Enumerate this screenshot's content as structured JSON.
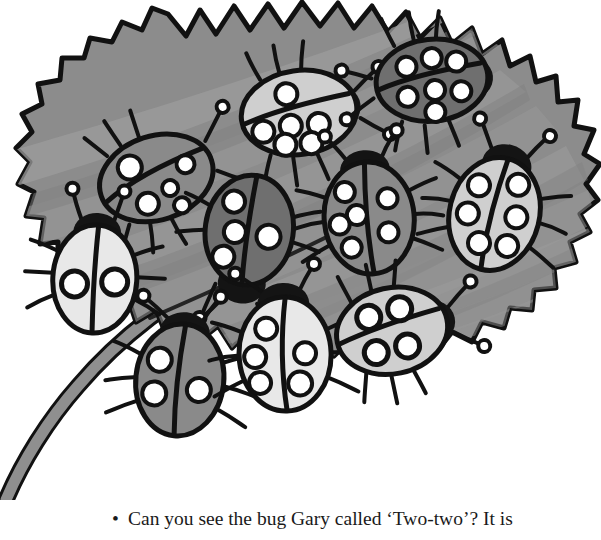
{
  "page": {
    "background_color": "#ffffff",
    "width": 601,
    "height": 540
  },
  "caption": {
    "bullet": "•",
    "text": "Can you see the bug Gary called ‘Two-two’? It is",
    "full_line": "• Can you see the bug Gary called ‘Two-two’? It is",
    "color": "#1a1a1a"
  },
  "illustration": {
    "type": "line-drawing",
    "subject": "serrated leaf covered with ladybugs",
    "palette": {
      "outline": "#111111",
      "leaf_mid": "#8c8c8c",
      "leaf_light": "#9e9e9e",
      "leaf_dark": "#7d7d7d",
      "leaf_vein": "#ababab",
      "stem": "#8f8f8f",
      "bug_dark": "#6f6f6f",
      "bug_mid": "#8a8a8a",
      "bug_light": "#cfcfcf",
      "bug_pale": "#e8e8e8",
      "spot_white": "#ffffff",
      "head_black": "#141414",
      "paper": "#ffffff"
    },
    "leaf": {
      "name": "leaf",
      "teeth_count": 34,
      "vein_count": 9,
      "has_stem": true,
      "stem_position": "bottom-left"
    },
    "bugs": [
      {
        "id": "bug-top-left",
        "label": "Three-three",
        "body_shade": "bug_mid",
        "spots_left": 3,
        "spots_right": 3,
        "spots_total": 6,
        "rotation_deg": -18,
        "cx": 162,
        "cy": 176,
        "rx": 62,
        "ry": 44
      },
      {
        "id": "bug-top-center",
        "label": "Three-four",
        "body_shade": "bug_light",
        "spots_left": 3,
        "spots_right": 4,
        "spots_total": 7,
        "rotation_deg": -8,
        "cx": 303,
        "cy": 112,
        "rx": 60,
        "ry": 43
      },
      {
        "id": "bug-top-right",
        "label": "Three-four",
        "body_shade": "bug_dark",
        "spots_left": 3,
        "spots_right": 4,
        "spots_total": 7,
        "rotation_deg": -6,
        "cx": 434,
        "cy": 80,
        "rx": 58,
        "ry": 42
      },
      {
        "id": "bug-left-white",
        "label": "One-one",
        "body_shade": "bug_pale",
        "spots_left": 1,
        "spots_right": 1,
        "spots_total": 2,
        "rotation_deg": 3,
        "cx": 95,
        "cy": 275,
        "rx": 42,
        "ry": 56
      },
      {
        "id": "bug-center-dark",
        "label": "Three-one",
        "body_shade": "bug_dark",
        "spots_left": 3,
        "spots_right": 1,
        "spots_total": 4,
        "rotation_deg": 8,
        "cx": 249,
        "cy": 232,
        "rx": 44,
        "ry": 56
      },
      {
        "id": "bug-center-right",
        "label": "Four-two",
        "body_shade": "bug_mid",
        "spots_left": 4,
        "spots_right": 2,
        "spots_total": 6,
        "rotation_deg": -5,
        "cx": 369,
        "cy": 216,
        "rx": 45,
        "ry": 57
      },
      {
        "id": "bug-right-light",
        "label": "Three-three",
        "body_shade": "bug_light",
        "spots_left": 3,
        "spots_right": 3,
        "spots_total": 6,
        "rotation_deg": 14,
        "cx": 495,
        "cy": 212,
        "rx": 45,
        "ry": 58
      },
      {
        "id": "bug-bottom-left",
        "label": "Two-one",
        "body_shade": "bug_mid",
        "spots_left": 2,
        "spots_right": 1,
        "spots_total": 3,
        "rotation_deg": 6,
        "cx": 180,
        "cy": 378,
        "rx": 44,
        "ry": 56
      },
      {
        "id": "bug-bottom-center",
        "label": "Three-three",
        "body_shade": "bug_pale",
        "spots_left": 3,
        "spots_right": 3,
        "spots_total": 6,
        "rotation_deg": -2,
        "cx": 285,
        "cy": 352,
        "rx": 46,
        "ry": 58
      },
      {
        "id": "bug-two-two",
        "label": "Two-two",
        "body_shade": "bug_light",
        "spots_left": 2,
        "spots_right": 2,
        "spots_total": 4,
        "rotation_deg": -12,
        "cx": 396,
        "cy": 330,
        "rx": 57,
        "ry": 44,
        "is_answer": true
      }
    ]
  }
}
